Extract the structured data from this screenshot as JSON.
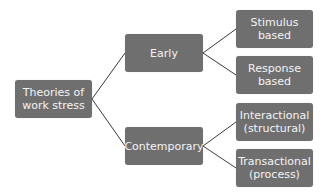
{
  "diagram": {
    "root": {
      "label": "Theories of\nwork stress"
    },
    "branches": [
      {
        "label": "Early",
        "children": [
          {
            "label": "Stimulus\nbased"
          },
          {
            "label": "Response\nbased"
          }
        ]
      },
      {
        "label": "Contemporary",
        "children": [
          {
            "label": "Interactional\n(structural)"
          },
          {
            "label": "Transactional\n(process)"
          }
        ]
      }
    ],
    "colors": {
      "node_fill": "#6f6f6f",
      "node_text": "#f4f4f4",
      "connector": "#3a3a3a"
    }
  }
}
